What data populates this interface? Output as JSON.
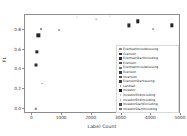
{
  "chart_data": {
    "type": "scatter",
    "title": "",
    "xlabel": "Label Count",
    "ylabel": "F1",
    "xlim": [
      -250,
      5000
    ],
    "ylim": [
      -0.05,
      0.95
    ],
    "grid": false,
    "legend_position": "right",
    "xticks": [
      0,
      1000,
      2000,
      3000,
      4000,
      5000
    ],
    "xtick_labels": [
      "0",
      "1000",
      "2000",
      "3000",
      "4000",
      "5000"
    ],
    "yticks": [
      0.0,
      0.2,
      0.4,
      0.6,
      0.8
    ],
    "ytick_labels": [
      "0.0",
      "0.2",
      "0.4",
      "0.6",
      "0.8"
    ],
    "points": [
      {
        "label": "EventsetIncludeIssuing",
        "x": 300,
        "y": 0.805,
        "size": 2.0,
        "color": "#9a9a9a"
      },
      {
        "label": "Eversion",
        "x": 200,
        "y": 0.745,
        "size": 3.3,
        "color": "#262626"
      },
      {
        "label": "EventsetStartIncluding",
        "x": 150,
        "y": 0.575,
        "size": 3.3,
        "color": "#262626"
      },
      {
        "label": "Eversion",
        "x": 120,
        "y": 0.445,
        "size": 3.0,
        "color": "#2e2e2e"
      },
      {
        "label": "EventsetIncludeIssuing",
        "x": 900,
        "y": 0.795,
        "size": 1.9,
        "color": "#a8a8a8"
      },
      {
        "label": "Eversion",
        "x": 330,
        "y": 0.255,
        "size": 1.7,
        "color": "#b4b4b4"
      },
      {
        "label": "Inversion",
        "x": 110,
        "y": 0.005,
        "size": 2.4,
        "color": "#808080"
      },
      {
        "label": "EversionStartIssuing",
        "x": 3250,
        "y": 0.845,
        "size": 3.2,
        "color": "#2b2b2b"
      },
      {
        "label": "Landsat",
        "x": 3550,
        "y": 0.885,
        "size": 3.4,
        "color": "#1f1f1f"
      },
      {
        "label": "Investor",
        "x": 4050,
        "y": 0.805,
        "size": 1.8,
        "color": "#b0b0b0"
      },
      {
        "label": "InvestorEndIncluding",
        "x": 4700,
        "y": 0.845,
        "size": 3.3,
        "color": "#242424"
      },
      {
        "label": "InvestorEndIncluding",
        "x": 2150,
        "y": 0.905,
        "size": 1.4,
        "color": "#cccccc"
      },
      {
        "label": "InvestorStartExcluding",
        "x": 1500,
        "y": 0.925,
        "size": 1.2,
        "color": "#d5d5d5"
      },
      {
        "label": "InvestorStartIncluding",
        "x": 2600,
        "y": 0.935,
        "size": 1.2,
        "color": "#dadada"
      }
    ],
    "legend_entries": [
      {
        "label": "EventsetIncludeIssuing",
        "marker_size": 2.2,
        "color": "#8c8c8c"
      },
      {
        "label": "Eversion",
        "marker_size": 2.6,
        "color": "#3a3a3a"
      },
      {
        "label": "EventsetStartIncluding",
        "marker_size": 2.6,
        "color": "#333333"
      },
      {
        "label": "Eversion",
        "marker_size": 2.4,
        "color": "#4a4a4a"
      },
      {
        "label": "EventsetIncludeIssuing",
        "marker_size": 2.3,
        "color": "#6f6f6f"
      },
      {
        "label": "Eversion",
        "marker_size": 2.5,
        "color": "#3d3d3d"
      },
      {
        "label": "Inversion",
        "marker_size": 2.4,
        "color": "#555555"
      },
      {
        "label": "EversionStartIssuing",
        "marker_size": 2.5,
        "color": "#3f3f3f"
      },
      {
        "label": "Landsat",
        "marker_size": 1.8,
        "color": "#a5a5a5"
      },
      {
        "label": "Investor",
        "marker_size": 2.8,
        "color": "#1f1f1f"
      },
      {
        "label": "InvestorEndIncluding",
        "marker_size": 1.6,
        "color": "#c0c0c0"
      },
      {
        "label": "InvestorEndIncluding",
        "marker_size": 1.7,
        "color": "#b8b8b8"
      },
      {
        "label": "InvestorStartExcluding",
        "marker_size": 2.4,
        "color": "#4f4f4f"
      },
      {
        "label": "InvestorStartIncluding",
        "marker_size": 2.2,
        "color": "#777777"
      }
    ]
  }
}
